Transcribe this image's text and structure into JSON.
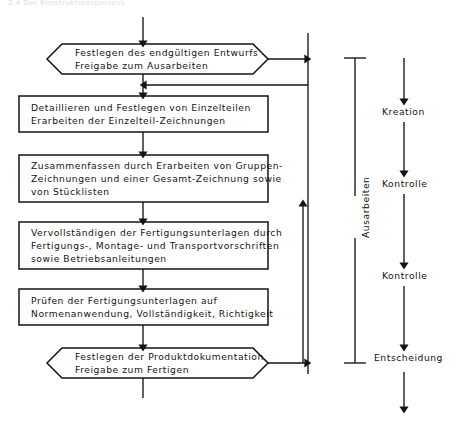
{
  "page": {
    "header_faint": "2.4   Der Konstruktionsprozess",
    "background": "#ffffff",
    "ink": "#141414"
  },
  "diagram": {
    "type": "flowchart",
    "nodes": [
      {
        "id": "n1",
        "shape": "hexagon",
        "lines": [
          "Festlegen des endgültigen Entwurfs",
          "Freigabe zum Ausarbeiten"
        ]
      },
      {
        "id": "n2",
        "shape": "rectangle",
        "lines": [
          "Detaillieren und Festlegen von Einzelteilen",
          "Erarbeiten der Einzelteil-Zeichnungen"
        ]
      },
      {
        "id": "n3",
        "shape": "rectangle",
        "lines": [
          "Zusammenfassen durch Erarbeiten von Gruppen-",
          "Zeichnungen und einer Gesamt-Zeichnung sowie",
          "von Stücklisten"
        ]
      },
      {
        "id": "n4",
        "shape": "rectangle",
        "lines": [
          "Vervollständigen der Fertigungsunterlagen durch",
          "Fertigungs-, Montage- und Transportvorschriften",
          "sowie Betriebsanleitungen"
        ]
      },
      {
        "id": "n5",
        "shape": "rectangle",
        "lines": [
          "Prüfen der Fertigungsunterlagen auf",
          "Normenanwendung, Vollständigkeit, Richtigkeit"
        ]
      },
      {
        "id": "n6",
        "shape": "hexagon",
        "lines": [
          "Festlegen der Produktdokumentation",
          "Freigabe zum Fertigen"
        ]
      }
    ],
    "phase_bracket": {
      "label": "Ausarbeiten",
      "orientation": "vertical"
    },
    "stage_labels": [
      {
        "id": "s1",
        "label": "Kreation"
      },
      {
        "id": "s2",
        "label": "Kontrolle"
      },
      {
        "id": "s3",
        "label": "Kontrolle"
      },
      {
        "id": "s4",
        "label": "Entscheidung"
      }
    ]
  }
}
